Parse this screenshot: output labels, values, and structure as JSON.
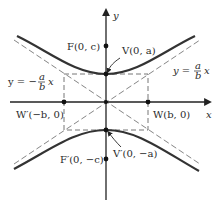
{
  "diagram": {
    "type": "hyperbola-vertical-transverse-axis",
    "axes": {
      "x_label": "x",
      "y_label": "y"
    },
    "points": {
      "focus_upper": {
        "label": "F(0, c)"
      },
      "vertex_upper": {
        "label": "V(0, a)"
      },
      "vertex_lower": {
        "label": "V′(0, −a)"
      },
      "focus_lower": {
        "label": "F′(0, −c)"
      },
      "w_right": {
        "label": "W(b, 0)"
      },
      "w_left": {
        "label": "W′(−b, 0)"
      }
    },
    "asymptotes": {
      "left": {
        "lhs": "y = −",
        "num": "a",
        "den": "b",
        "var": "x"
      },
      "right": {
        "lhs": "y = ",
        "num": "a",
        "den": "b",
        "var": "x"
      }
    },
    "colors": {
      "curve": "#333333",
      "axis": "#222222",
      "dash": "#666666"
    }
  }
}
